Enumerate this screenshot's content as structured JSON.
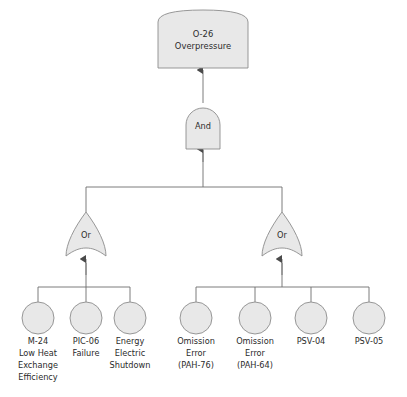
{
  "diagram": {
    "type": "fault-tree",
    "background_color": "#ffffff",
    "shape_fill": "#e8e8e8",
    "shape_stroke": "#8c8c8c",
    "line_color": "#6e6e6e",
    "text_color": "#2b2b2b"
  },
  "top_event": {
    "id": "O-26",
    "line1": "O-26",
    "line2": "Overpressure",
    "shape": "rounded-top-rectangle"
  },
  "and_gate": {
    "label": "And",
    "shape": "and-gate"
  },
  "or_gates": [
    {
      "label": "Or",
      "shape": "or-gate",
      "side": "left"
    },
    {
      "label": "Or",
      "shape": "or-gate",
      "side": "right"
    }
  ],
  "basic_events_left": [
    {
      "lines": [
        "M-24",
        "Low Heat",
        "Exchange",
        "Efficiency"
      ]
    },
    {
      "lines": [
        "PIC-06",
        "Failure"
      ]
    },
    {
      "lines": [
        "Energy",
        "Electric",
        "Shutdown"
      ]
    }
  ],
  "basic_events_right": [
    {
      "lines": [
        "Omission",
        "Error",
        "(PAH-76)"
      ]
    },
    {
      "lines": [
        "Omission",
        "Error",
        "(PAH-64)"
      ]
    },
    {
      "lines": [
        "PSV-04"
      ]
    },
    {
      "lines": [
        "PSV-05"
      ]
    }
  ]
}
